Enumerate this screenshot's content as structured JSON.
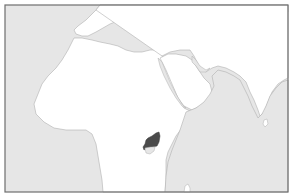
{
  "map": {
    "region": "Africa, Europe, Middle East and Indian Ocean outline map",
    "highlighted_feature": "Uganda",
    "colors": {
      "ocean": "#e6e6e6",
      "land": "#ffffff",
      "coastline": "#b0b0b0",
      "highlight": "#4a4a4a",
      "frame": "#6e6e6e",
      "lake": "#e6e6e6"
    }
  }
}
